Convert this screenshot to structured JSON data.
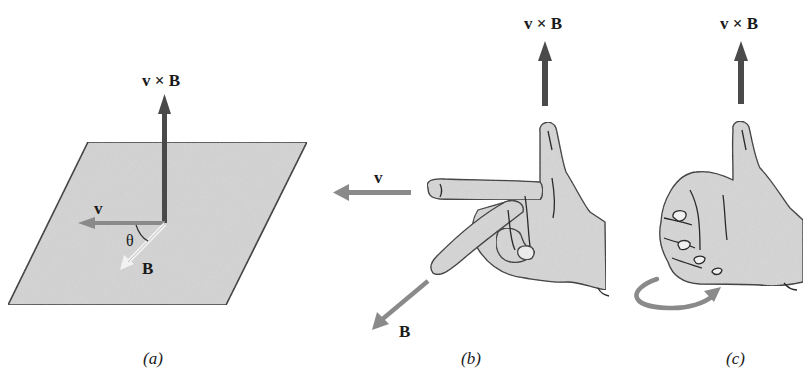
{
  "figure": {
    "panels": [
      {
        "id": "a",
        "caption": "(a)",
        "labels": {
          "cross_product": "v × B",
          "velocity": "v",
          "field": "B",
          "angle": "θ"
        },
        "description": "Shaded plane containing v and B separated by angle θ; v × B perpendicular to plane"
      },
      {
        "id": "b",
        "caption": "(b)",
        "labels": {
          "cross_product": "v × B",
          "velocity": "v",
          "field": "B"
        },
        "description": "Right hand: index finger along v, middle finger along B, thumb along v × B"
      },
      {
        "id": "c",
        "caption": "(c)",
        "labels": {
          "cross_product": "v × B"
        },
        "description": "Right hand curl: fingers curl from v toward B, thumb points along v × B"
      }
    ],
    "colors": {
      "cross_product_arrow": "#4a4a4a",
      "vector_arrow": "#8a8a8a",
      "plane_fill": "#d4d4d4",
      "outline": "#2a2a2a",
      "hand_fill": "#d6d6d6",
      "text": "#1a1a1a"
    }
  }
}
